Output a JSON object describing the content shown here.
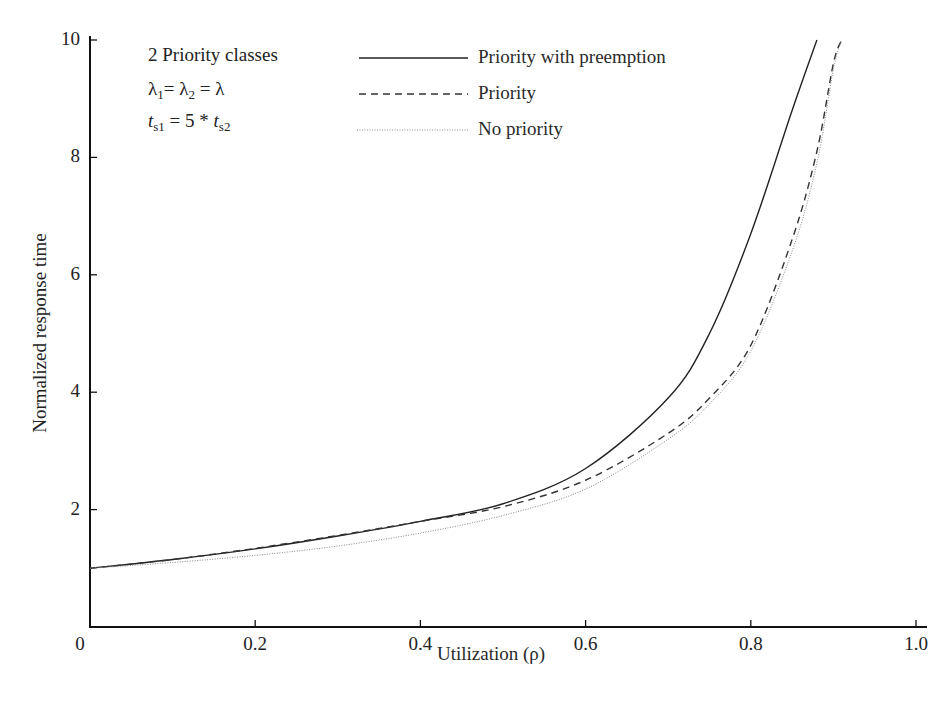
{
  "chart_data": {
    "type": "line",
    "title": "",
    "xlabel": "Utilization (ρ)",
    "ylabel": "Normalized response time",
    "xlim": [
      0,
      1.0
    ],
    "ylim": [
      0,
      10
    ],
    "x_ticks": [
      "0",
      "0.2",
      "0.4",
      "0.6",
      "0.8",
      "1.0"
    ],
    "y_ticks": [
      "2",
      "4",
      "6",
      "8",
      "10"
    ],
    "grid": false,
    "legend_position": "top",
    "annotations": [
      "2 Priority classes",
      "λ1 = λ2 = λ",
      "ts1 = 5 * ts2"
    ],
    "x": [
      0,
      0.1,
      0.2,
      0.3,
      0.4,
      0.5,
      0.6,
      0.7,
      0.75,
      0.8,
      0.85,
      0.88,
      0.9,
      0.91
    ],
    "series": [
      {
        "name": "Priority with preemption",
        "style": "solid",
        "values": [
          1.0,
          1.15,
          1.33,
          1.55,
          1.8,
          2.1,
          2.7,
          3.9,
          5.0,
          6.7,
          8.8,
          10.0,
          null,
          null
        ]
      },
      {
        "name": "Priority",
        "style": "dashed",
        "values": [
          1.0,
          1.15,
          1.34,
          1.56,
          1.8,
          2.05,
          2.5,
          3.3,
          3.9,
          4.8,
          6.6,
          8.1,
          9.6,
          10.0
        ]
      },
      {
        "name": "No priority",
        "style": "dotted",
        "values": [
          1.0,
          1.1,
          1.22,
          1.38,
          1.6,
          1.9,
          2.35,
          3.2,
          3.8,
          4.7,
          6.4,
          7.9,
          9.5,
          10.0
        ]
      }
    ]
  },
  "axis": {
    "x_label": "Utilization (ρ)",
    "y_label": "Normalized response time",
    "x_ticks": [
      "0",
      "0.2",
      "0.4",
      "0.6",
      "0.8",
      "1.0"
    ],
    "y_ticks": [
      "2",
      "4",
      "6",
      "8",
      "10"
    ]
  },
  "annotation": {
    "line1": "2 Priority classes",
    "lambda": "λ",
    "sub1": "1",
    "sub2": "2",
    "eq": "=",
    "ts": "t",
    "s1": "s1",
    "s2": "s2",
    "five": "= 5 *"
  },
  "legend": [
    {
      "label": "Priority with preemption"
    },
    {
      "label": "Priority"
    },
    {
      "label": "No priority"
    }
  ]
}
